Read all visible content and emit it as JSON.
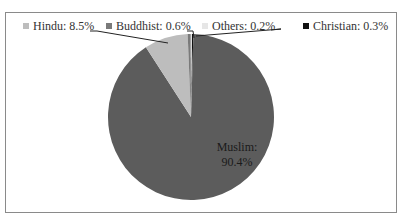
{
  "chart_data": {
    "type": "pie",
    "title": "",
    "categories": [
      "Muslim",
      "Hindu",
      "Buddhist",
      "Others",
      "Christian"
    ],
    "values": [
      90.4,
      8.5,
      0.6,
      0.2,
      0.3
    ],
    "unit": "%",
    "colors": {
      "Muslim": "#5c5c5c",
      "Hindu": "#bdbdbd",
      "Buddhist": "#7a7a7a",
      "Others": "#e6e6e6",
      "Christian": "#111111"
    },
    "labels": [
      {
        "text": "Muslim:",
        "value": "90.4%",
        "position": "inside"
      },
      {
        "text": "Hindu: 8.5%",
        "position": "outside-top"
      },
      {
        "text": "Buddhist: 0.6%",
        "position": "outside-top"
      },
      {
        "text": "Others: 0.2%",
        "position": "outside-top"
      },
      {
        "text": "Christian: 0.3%",
        "position": "outside-top"
      }
    ],
    "legend_position": "none"
  },
  "texts": {
    "hindu": "Hindu: 8.5%",
    "buddhist": "Buddhist: 0.6%",
    "others": "Others: 0.2%",
    "christian": "Christian: 0.3%",
    "muslim_name": "Muslim:",
    "muslim_value": "90.4%",
    "cut_caption": "…p… …p… …g… …p… … …(… g… …)…"
  }
}
